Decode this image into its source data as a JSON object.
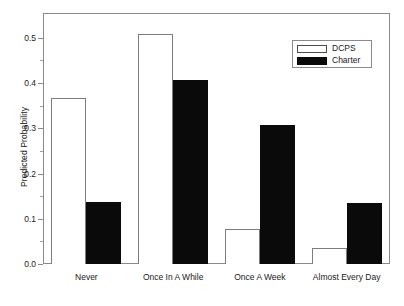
{
  "chart_data": {
    "type": "bar",
    "title": "",
    "subtitle": "",
    "xlabel": "",
    "ylabel": "Predicted Probability",
    "categories": [
      "Never",
      "Once In A While",
      "Once A Week",
      "Almost Every Day"
    ],
    "series": [
      {
        "name": "DCPS",
        "color": "#ffffff",
        "edge_color": "#7d7d7d",
        "values": [
          0.367,
          0.508,
          0.077,
          0.036
        ]
      },
      {
        "name": "Charter",
        "color": "#0a0a0a",
        "edge_color": "#0a0a0a",
        "values": [
          0.138,
          0.407,
          0.307,
          0.135
        ]
      }
    ],
    "ylim": [
      0.0,
      0.555
    ],
    "xlim": [
      0,
      4
    ],
    "y_ticks_major": [
      0.0,
      0.1,
      0.2,
      0.3,
      0.4,
      0.5
    ],
    "y_tick_labels": [
      "0.0",
      "0.1",
      "0.2",
      "0.3",
      "0.4",
      "0.5"
    ],
    "y_ticks_minor": [
      0.05,
      0.15,
      0.25,
      0.35,
      0.45
    ],
    "grid": false,
    "legend_position": "top-right",
    "legend_entries": [
      "DCPS",
      "Charter"
    ]
  },
  "axes": {
    "y_title": "Predicted Probability"
  },
  "legend": {
    "items": [
      {
        "label": "DCPS",
        "style": "hollow"
      },
      {
        "label": "Charter",
        "style": "filled"
      }
    ]
  }
}
